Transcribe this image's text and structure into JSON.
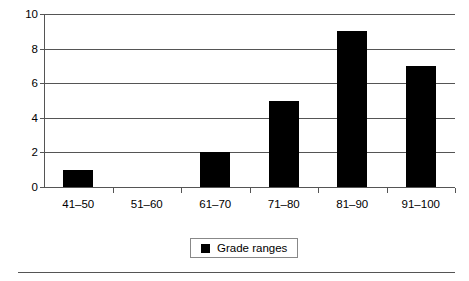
{
  "chart_data": {
    "type": "bar",
    "title": "",
    "subtitle": "",
    "xlabel": "",
    "ylabel": "",
    "categories": [
      "41–50",
      "51–60",
      "61–70",
      "71–80",
      "81–90",
      "91–100"
    ],
    "values": [
      1,
      0,
      2,
      5,
      9,
      7
    ],
    "series": [
      {
        "name": "Grade ranges",
        "values": [
          1,
          0,
          2,
          5,
          9,
          7
        ],
        "color": "#000000"
      }
    ],
    "ylim": [
      0,
      10
    ],
    "ytick_labels": [
      "0",
      "2",
      "4",
      "6",
      "8",
      "10"
    ],
    "ytick_values": [
      0,
      2,
      4,
      6,
      8,
      10
    ],
    "grid": true,
    "grid_axis": "y",
    "legend": {
      "position": "bottom-center",
      "boxed": true,
      "entries": [
        {
          "label": "Grade ranges",
          "marker": "square",
          "color": "#000000"
        }
      ]
    },
    "colors": {
      "bar": "#000000",
      "axis": "#555555",
      "grid": "#555555",
      "background": "#ffffff",
      "text": "#000000",
      "legend_border": "#888888"
    }
  }
}
